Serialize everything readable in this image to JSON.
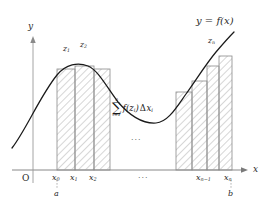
{
  "figure": {
    "title_label": "y = f(x)",
    "axes": {
      "y_label": "y",
      "x_label": "x",
      "origin_label": "O"
    },
    "curve_label": "y = f(x)",
    "sum_expression": {
      "upper_limit": "n",
      "sigma": "∑",
      "lower_limit": "i=1",
      "term_f": "f(z",
      "term_f_sub": "i",
      "term_f_close": ")",
      "delta": "Δ",
      "term_dx": "x",
      "term_dx_sub": "i",
      "plain": "∑ f(z_i) Δx_i"
    },
    "ellipsis_middle": "···",
    "ellipsis_axis": "···",
    "x_ticks": [
      {
        "id": "x0",
        "base": "x",
        "sub": "0",
        "x": 57,
        "under": "a"
      },
      {
        "id": "x1",
        "base": "x",
        "sub": "1",
        "x": 75,
        "under": ""
      },
      {
        "id": "x2",
        "base": "x",
        "sub": "2",
        "x": 94,
        "under": ""
      },
      {
        "id": "xn1",
        "base": "x",
        "sub": "n−1",
        "x": 207,
        "under": ""
      },
      {
        "id": "xn",
        "base": "x",
        "sub": "n",
        "x": 231,
        "under": "b"
      }
    ],
    "z_labels": [
      {
        "id": "z1",
        "base": "z",
        "sub": "1",
        "x": 66,
        "y": 47
      },
      {
        "id": "z2",
        "base": "z",
        "sub": "2",
        "x": 83,
        "y": 43
      },
      {
        "id": "zn",
        "base": "z",
        "sub": "n",
        "x": 211,
        "y": 40
      }
    ],
    "endpoint_labels": [
      {
        "id": "a",
        "text": "a",
        "x": 57
      },
      {
        "id": "b",
        "text": "b",
        "x": 231
      }
    ],
    "rectangles_left": [
      {
        "x": 57,
        "w": 18,
        "top": 69
      },
      {
        "x": 75,
        "w": 19,
        "top": 66
      },
      {
        "x": 94,
        "w": 16,
        "top": 69
      }
    ],
    "rectangles_right": [
      {
        "x": 176,
        "w": 16,
        "top": 92
      },
      {
        "x": 192,
        "w": 15,
        "top": 81
      },
      {
        "x": 207,
        "w": 12,
        "top": 66
      },
      {
        "x": 219,
        "w": 13,
        "top": 56
      }
    ],
    "colors": {
      "axis": "#6b6b6b",
      "curve": "#111111",
      "rect_stroke": "#8a8a8a",
      "hatch": "#b8b8b8",
      "text": "#2a2a2a",
      "background": "#ffffff"
    },
    "axis_geometry": {
      "baseline_y": 170,
      "y_axis_x": 33,
      "y_axis_top": 36,
      "x_axis_left": 12,
      "x_axis_right": 247
    }
  }
}
